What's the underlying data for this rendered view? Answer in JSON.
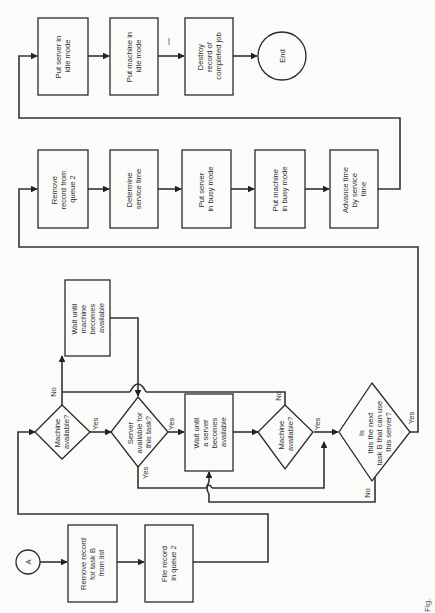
{
  "diagram": {
    "orientation": "rotated 90 degrees counter-clockwise",
    "caption_fragment": "Fig.",
    "nodes": {
      "connector_a": {
        "type": "connector",
        "label": "A"
      },
      "remove_task_b": {
        "type": "process",
        "lines": [
          "Remove record",
          "for task B",
          "from list"
        ]
      },
      "file_queue2": {
        "type": "process",
        "lines": [
          "File record",
          "in queue 2"
        ]
      },
      "machine_avail_1": {
        "type": "decision",
        "lines": [
          "Machine",
          "available?"
        ]
      },
      "wait_machine": {
        "type": "process",
        "lines": [
          "Wait until",
          "machine",
          "becomes",
          "available"
        ]
      },
      "server_avail": {
        "type": "decision",
        "lines": [
          "Server",
          "available for",
          "this task?"
        ]
      },
      "wait_server": {
        "type": "process",
        "lines": [
          "Wait until",
          "a server",
          "becomes",
          "available"
        ]
      },
      "machine_avail_2": {
        "type": "decision",
        "lines": [
          "Machine",
          "available?"
        ]
      },
      "next_task_b": {
        "type": "decision",
        "lines": [
          "Is",
          "this the next",
          "task B that can use",
          "this server?"
        ]
      },
      "remove_queue2": {
        "type": "process",
        "lines": [
          "Remove",
          "record from",
          "queue 2"
        ]
      },
      "determine_service": {
        "type": "process",
        "lines": [
          "Determine",
          "service time"
        ]
      },
      "server_busy": {
        "type": "process",
        "lines": [
          "Put server",
          "in busy mode"
        ]
      },
      "machine_busy": {
        "type": "process",
        "lines": [
          "Put machine",
          "in busy mode"
        ]
      },
      "advance_time": {
        "type": "process",
        "lines": [
          "Advance time",
          "by service",
          "time"
        ]
      },
      "server_idle": {
        "type": "process",
        "lines": [
          "Put server in",
          "idle mode"
        ]
      },
      "machine_idle": {
        "type": "process",
        "lines": [
          "Put machine in",
          "idle mode"
        ]
      },
      "destroy_record": {
        "type": "process",
        "lines": [
          "Destroy",
          "record of",
          "completed job"
        ]
      },
      "end": {
        "type": "terminal",
        "label": "End"
      }
    },
    "edge_labels": {
      "yes": "Yes",
      "no": "No"
    },
    "edges": [
      {
        "from": "connector_a",
        "to": "remove_task_b"
      },
      {
        "from": "remove_task_b",
        "to": "file_queue2"
      },
      {
        "from": "file_queue2",
        "to": "machine_avail_1"
      },
      {
        "from": "machine_avail_1",
        "to": "server_avail",
        "label": "Yes"
      },
      {
        "from": "machine_avail_1",
        "to": "wait_machine",
        "label": "No"
      },
      {
        "from": "wait_machine",
        "to": "server_avail"
      },
      {
        "from": "server_avail",
        "to": "wait_server",
        "label": "Yes"
      },
      {
        "from": "server_avail",
        "to": "next_task_b",
        "label": "Yes"
      },
      {
        "from": "wait_server",
        "to": "machine_avail_2"
      },
      {
        "from": "machine_avail_2",
        "to": "next_task_b",
        "label": "Yes"
      },
      {
        "from": "machine_avail_2",
        "to": "wait_machine",
        "label": "No"
      },
      {
        "from": "next_task_b",
        "to": "wait_server",
        "label": "No"
      },
      {
        "from": "next_task_b",
        "to": "remove_queue2",
        "label": "Yes"
      },
      {
        "from": "remove_queue2",
        "to": "determine_service"
      },
      {
        "from": "determine_service",
        "to": "server_busy"
      },
      {
        "from": "server_busy",
        "to": "machine_busy"
      },
      {
        "from": "machine_busy",
        "to": "advance_time"
      },
      {
        "from": "advance_time",
        "to": "server_idle"
      },
      {
        "from": "server_idle",
        "to": "machine_idle"
      },
      {
        "from": "machine_idle",
        "to": "destroy_record"
      },
      {
        "from": "destroy_record",
        "to": "end"
      }
    ]
  }
}
